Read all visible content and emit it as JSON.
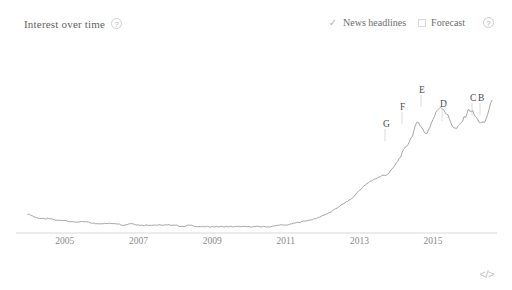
{
  "header": {
    "title": "Interest over time",
    "help_icon": "help-question-icon",
    "help_glyph": "?",
    "controls": [
      {
        "label": "News headlines",
        "checked": true,
        "glyph": "✓"
      },
      {
        "label": "Forecast",
        "checked": false,
        "glyph": ""
      }
    ],
    "controls_help_glyph": "?"
  },
  "footer": {
    "embed_label": "</>",
    "embed_icon": "embed-code-icon"
  },
  "colors": {
    "line": "#9a9a9a",
    "axis": "#d9d9d9",
    "text": "#5f5f5f",
    "axis_text": "#8a8a8a",
    "marker_text": "#4a4a4a",
    "marker_tick": "#cccccc",
    "background": "#ffffff"
  },
  "chart_data": {
    "type": "line",
    "title": "Interest over time",
    "xlabel": "",
    "ylabel": "",
    "grid": false,
    "legend": "none",
    "xlim": [
      2004.0,
      2016.6
    ],
    "ylim": [
      0,
      100
    ],
    "xtick_labels": [
      "2005",
      "2007",
      "2009",
      "2011",
      "2013",
      "2015"
    ],
    "xtick_values": [
      2005,
      2007,
      2009,
      2011,
      2013,
      2015
    ],
    "series": [
      {
        "name": "Search interest",
        "x": [
          2004.0,
          2004.2,
          2004.4,
          2004.6,
          2004.8,
          2005.0,
          2005.2,
          2005.4,
          2005.6,
          2005.8,
          2006.0,
          2006.2,
          2006.4,
          2006.6,
          2006.8,
          2007.0,
          2007.2,
          2007.4,
          2007.6,
          2007.8,
          2008.0,
          2008.2,
          2008.4,
          2008.6,
          2008.8,
          2009.0,
          2009.2,
          2009.4,
          2009.6,
          2009.8,
          2010.0,
          2010.2,
          2010.4,
          2010.6,
          2010.8,
          2011.0,
          2011.2,
          2011.4,
          2011.6,
          2011.8,
          2012.0,
          2012.2,
          2012.4,
          2012.6,
          2012.8,
          2013.0,
          2013.2,
          2013.4,
          2013.6,
          2013.8,
          2014.0,
          2014.2,
          2014.4,
          2014.6,
          2014.8,
          2015.0,
          2015.2,
          2015.4,
          2015.6,
          2015.8,
          2016.0,
          2016.2,
          2016.4,
          2016.6
        ],
        "values": [
          12,
          10,
          9,
          9,
          8,
          8,
          7,
          7,
          7,
          6,
          6,
          6,
          6,
          5,
          6,
          5,
          5,
          5,
          5,
          5,
          5,
          4,
          5,
          4,
          4,
          4,
          4,
          4,
          4,
          4,
          4,
          4,
          4,
          4,
          5,
          5,
          6,
          7,
          8,
          9,
          11,
          13,
          16,
          19,
          22,
          27,
          31,
          34,
          36,
          38,
          44,
          52,
          60,
          70,
          63,
          72,
          80,
          74,
          66,
          71,
          78,
          72,
          70,
          84
        ]
      }
    ],
    "annotations": [
      {
        "label": "G",
        "x_px": 383,
        "y_px": 127
      },
      {
        "label": "F",
        "x_px": 400,
        "y_px": 110
      },
      {
        "label": "E",
        "x_px": 419,
        "y_px": 93
      },
      {
        "label": "D",
        "x_px": 440,
        "y_px": 107
      },
      {
        "label": "C",
        "x_px": 470,
        "y_px": 101
      },
      {
        "label": "B",
        "x_px": 478,
        "y_px": 101
      }
    ]
  }
}
